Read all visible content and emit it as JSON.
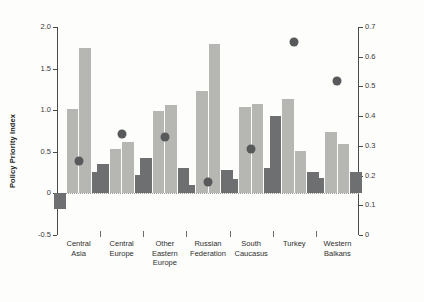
{
  "chart_data": {
    "type": "bar",
    "title": "",
    "subtitle": "",
    "categories": [
      "Central\nAsia",
      "Central\nEurope",
      "Other\nEastern\nEurope",
      "Russian\nFederation",
      "South\nCaucasus",
      "Turkey",
      "Western\nBalkans"
    ],
    "series": [
      {
        "name": "bar-1",
        "axis": "left",
        "color": "#6e6f71",
        "values": [
          -0.19,
          0.35,
          0.43,
          0.1,
          0.17,
          0.93,
          0.19
        ]
      },
      {
        "name": "bar-2",
        "axis": "left",
        "color": "#b6b7b3",
        "values": [
          1.02,
          0.53,
          0.99,
          1.23,
          1.04,
          1.14,
          0.74
        ]
      },
      {
        "name": "bar-3",
        "axis": "left",
        "color": "#b6b7b3",
        "values": [
          1.75,
          0.62,
          1.06,
          1.79,
          1.08,
          0.51,
          0.59
        ]
      },
      {
        "name": "bar-4",
        "axis": "left",
        "color": "#6e6f71",
        "values": [
          0.26,
          0.22,
          0.3,
          0.28,
          0.31,
          0.26,
          0.26
        ]
      },
      {
        "name": "dot",
        "axis": "right",
        "color": "#58595b",
        "values": [
          0.25,
          0.34,
          0.33,
          0.18,
          0.29,
          0.65,
          0.52
        ]
      }
    ],
    "xlabel": "",
    "ylabel": "Policy Priority Index",
    "ylabel_right": "Propensity to trade-offs",
    "ylim": [
      -0.5,
      2.0
    ],
    "ylim_right": [
      0,
      0.7
    ],
    "yticks": [
      "2.0",
      "1.5",
      "1.0",
      "0.5",
      "0",
      "-0.5"
    ],
    "ytick_values": [
      2.0,
      1.5,
      1.0,
      0.5,
      0,
      -0.5
    ],
    "yticks_right": [
      "0.7",
      "0.6",
      "0.5",
      "0.4",
      "0.3",
      "0.2",
      "0.1",
      "0"
    ],
    "ytick_values_right": [
      0.7,
      0.6,
      0.5,
      0.4,
      0.3,
      0.2,
      0.1,
      0
    ],
    "grid": false,
    "legend": "none",
    "zero_line": true
  },
  "colors": {
    "bar_dark": "#6e6f71",
    "bar_light": "#b6b7b3",
    "dot": "#58595b",
    "axis": "#4a4a4a",
    "text": "#2e2e2e",
    "background": "#ffffff"
  }
}
